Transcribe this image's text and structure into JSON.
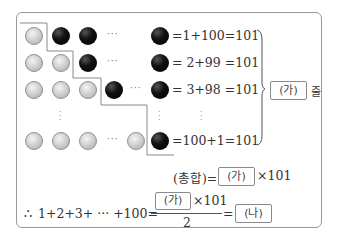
{
  "rows": [
    {
      "equation": "=1+100=101"
    },
    {
      "equation": "= 2+99 =101"
    },
    {
      "equation": "= 3+98 =101"
    },
    {
      "equation": "=100+1=101"
    }
  ],
  "dots": {
    "horizontal": "···",
    "vertical": "⋮"
  },
  "brace_label": {
    "blank": "(가)",
    "suffix": "줄"
  },
  "total_line": {
    "prefix": "(총합)=",
    "blank": "(가)",
    "suffix": "×101"
  },
  "conclusion": {
    "therefore": "∴",
    "lhs": "1+2+3+ ··· +100=",
    "numerator_blank": "(가)",
    "numerator_suffix": "×101",
    "denominator": "2",
    "equals": "=",
    "result_blank": "(나)"
  },
  "colors": {
    "gray_ball": "#c8c8c8",
    "black_ball": "#000000",
    "frame": "#9a9a9a"
  }
}
